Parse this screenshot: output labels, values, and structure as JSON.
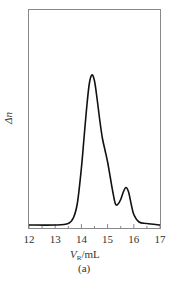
{
  "chart_data": {
    "type": "line",
    "title": "",
    "caption": "(a)",
    "xlabel": "V_R/mL",
    "xlabel_main": "V",
    "xlabel_sub": "R",
    "xlabel_unit": "/mL",
    "ylabel": "Δn",
    "xlim": [
      12,
      17.05
    ],
    "xticks": [
      12,
      13,
      14,
      15,
      16,
      17
    ],
    "grid": false,
    "legend": null,
    "series": [
      {
        "name": "Δn",
        "x": [
          12.0,
          13.0,
          13.5,
          13.7,
          13.85,
          14.0,
          14.1,
          14.2,
          14.3,
          14.4,
          14.5,
          14.6,
          14.7,
          14.8,
          14.9,
          15.0,
          15.1,
          15.2,
          15.3,
          15.4,
          15.5,
          15.6,
          15.7,
          15.8,
          15.9,
          16.0,
          16.2,
          16.5,
          17.0
        ],
        "y": [
          0.0,
          0.0,
          0.01,
          0.05,
          0.15,
          0.38,
          0.58,
          0.78,
          0.94,
          1.0,
          0.96,
          0.84,
          0.7,
          0.58,
          0.5,
          0.42,
          0.32,
          0.22,
          0.14,
          0.14,
          0.17,
          0.22,
          0.25,
          0.22,
          0.14,
          0.07,
          0.02,
          0.01,
          0.0
        ]
      }
    ],
    "peaks": [
      {
        "x": 14.4,
        "label": "main peak"
      },
      {
        "x": 14.9,
        "label": "shoulder"
      },
      {
        "x": 15.7,
        "label": "secondary peak"
      }
    ]
  }
}
